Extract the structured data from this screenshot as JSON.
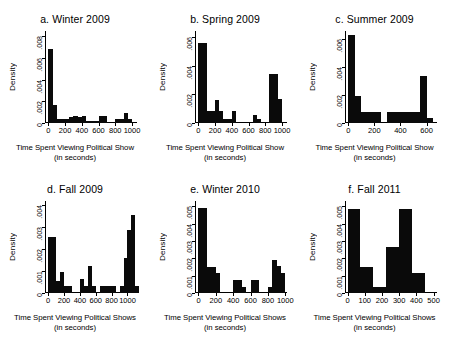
{
  "figure": {
    "panel_count": 6,
    "bar_color": "#0a0a0a",
    "axis_color": "#000000",
    "background": "#ffffff"
  },
  "common": {
    "ylabel": "Density",
    "xlabel_singular": "Time Spent Viewing Political Show",
    "xlabel_plural": "Time Spent Viewing Political Shows",
    "xunit": "(in seconds)"
  },
  "chart_data": [
    {
      "type": "bar",
      "panel": "a",
      "title": "a. Winter 2009",
      "xlabel": "Time Spent Viewing Political Show",
      "xunit": "(in seconds)",
      "ylabel": "Density",
      "xlim": [
        -40,
        1060
      ],
      "ylim": [
        0,
        0.0085
      ],
      "xticks": [
        0,
        200,
        400,
        600,
        800,
        1000
      ],
      "xticklabels": [
        "0",
        "200",
        "400",
        "600",
        "800",
        "1000"
      ],
      "yticks": [
        0,
        0.002,
        0.004,
        0.006,
        0.008
      ],
      "yticklabels": [
        "0",
        ".002",
        ".004",
        ".006",
        ".008"
      ],
      "bin_width": 50,
      "bins": [
        0,
        50,
        100,
        150,
        200,
        250,
        300,
        350,
        400,
        450,
        500,
        550,
        600,
        650,
        700,
        750,
        800,
        850,
        900,
        950,
        1000
      ],
      "values": [
        0.0068,
        0.00165,
        0.00035,
        0.00035,
        0.00035,
        0.0006,
        0.00065,
        0.0006,
        0.00065,
        0.0002,
        0.00022,
        0.0002,
        0.00065,
        0.00065,
        0.0,
        0.0,
        0.00035,
        0.00035,
        0.0009,
        0.00035
      ],
      "grid": false
    },
    {
      "type": "bar",
      "panel": "b",
      "title": "b. Spring 2009",
      "xlabel": "Time Spent Viewing Political Show",
      "xunit": "(in seconds)",
      "ylabel": "Density",
      "xlim": [
        -40,
        1060
      ],
      "ylim": [
        0,
        0.0064
      ],
      "xticks": [
        0,
        200,
        400,
        600,
        800,
        1000
      ],
      "xticklabels": [
        "0",
        "200",
        "400",
        "600",
        "800",
        "1000"
      ],
      "yticks": [
        0,
        0.002,
        0.004,
        0.006
      ],
      "yticklabels": [
        "0",
        ".002",
        ".004",
        ".006"
      ],
      "bin_width": 50,
      "bins": [
        0,
        50,
        100,
        150,
        200,
        250,
        300,
        350,
        400,
        450,
        500,
        550,
        600,
        650,
        700,
        750,
        800,
        850,
        900,
        950,
        1000
      ],
      "values": [
        0.00555,
        0.00555,
        0.00085,
        0.00085,
        0.0016,
        0.00085,
        0.00025,
        0.00025,
        0.00085,
        0.0,
        0.0,
        0.0,
        0.0,
        0.00055,
        0.00025,
        0.0,
        0.0,
        0.0034,
        0.0034,
        0.00165
      ],
      "grid": false
    },
    {
      "type": "bar",
      "panel": "c",
      "title": "c. Summer 2009",
      "xlabel": "Time Spent Viewing Political Show",
      "xunit": "(in seconds)",
      "ylabel": "Density",
      "xlim": [
        -25,
        680
      ],
      "ylim": [
        0,
        0.0066
      ],
      "xticks": [
        0,
        200,
        400,
        600
      ],
      "xticklabels": [
        "0",
        "200",
        "400",
        "600"
      ],
      "yticks": [
        0,
        0.002,
        0.004,
        0.006
      ],
      "yticklabels": [
        "0",
        ".002",
        ".004",
        ".006"
      ],
      "bin_width": 50,
      "bins": [
        0,
        50,
        100,
        150,
        200,
        250,
        300,
        350,
        400,
        450,
        500,
        550,
        600,
        650
      ],
      "values": [
        0.0063,
        0.00195,
        0.00077,
        0.00077,
        0.00077,
        0.0,
        0.00077,
        0.00077,
        0.00077,
        0.00077,
        0.00077,
        0.0034,
        0.00039
      ],
      "grid": false
    },
    {
      "type": "bar",
      "panel": "d",
      "title": "d. Fall 2009",
      "xlabel": "Time Spent Viewing Political Shows",
      "xunit": "(in seconds)",
      "ylabel": "Density",
      "xlim": [
        -40,
        1120
      ],
      "ylim": [
        0,
        0.0042
      ],
      "xticks": [
        0,
        200,
        400,
        600,
        800,
        1000
      ],
      "xticklabels": [
        "0",
        "200",
        "400",
        "600",
        "800",
        "1000"
      ],
      "yticks": [
        0,
        0.001,
        0.002,
        0.003,
        0.004
      ],
      "yticklabels": [
        "0",
        ".001",
        ".002",
        ".003",
        ".004"
      ],
      "bin_width": 50,
      "bins": [
        0,
        50,
        100,
        150,
        200,
        250,
        300,
        350,
        400,
        450,
        500,
        550,
        600,
        650,
        700,
        750,
        800,
        850,
        900,
        950,
        1000,
        1050,
        1100
      ],
      "values": [
        0.00255,
        0.00255,
        0.00055,
        0.00095,
        0.00033,
        0.00033,
        0.0,
        0.0,
        0.00065,
        0.00033,
        0.00125,
        0.00033,
        0.0,
        0.00033,
        0.00033,
        0.00033,
        0.00033,
        0.0,
        0.00033,
        0.00162,
        0.00288,
        0.00355,
        0.00033
      ],
      "grid": false
    },
    {
      "type": "bar",
      "panel": "e",
      "title": "e. Winter 2010",
      "xlabel": "Time Spent Viewing Political Shows",
      "xunit": "(in seconds)",
      "ylabel": "Density",
      "xlim": [
        -40,
        1020
      ],
      "ylim": [
        0,
        0.0053
      ],
      "xticks": [
        0,
        200,
        400,
        600,
        800,
        1000
      ],
      "xticklabels": [
        "0",
        "200",
        "400",
        "600",
        "800",
        "1000"
      ],
      "yticks": [
        0,
        0.001,
        0.002,
        0.003,
        0.004,
        0.005
      ],
      "yticklabels": [
        "0",
        ".001",
        ".002",
        ".003",
        ".004",
        ".005"
      ],
      "bin_width": 50,
      "bins": [
        0,
        50,
        100,
        150,
        200,
        250,
        300,
        350,
        400,
        450,
        500,
        550,
        600,
        650,
        700,
        750,
        800,
        850,
        900,
        950
      ],
      "values": [
        0.0049,
        0.0049,
        0.00148,
        0.00148,
        0.00115,
        0.0,
        0.0,
        0.0,
        0.00075,
        0.00075,
        0.00035,
        0.0,
        0.00075,
        0.00075,
        0.0,
        0.0,
        0.00035,
        0.00192,
        0.00155,
        0.00118
      ],
      "grid": false
    },
    {
      "type": "bar",
      "panel": "f",
      "title": "f. Fall 2011",
      "xlabel": "Time Spent Viewing Political Shows",
      "xunit": "(in seconds)",
      "ylabel": "Density",
      "xlim": [
        -15,
        520
      ],
      "ylim": [
        0,
        0.0053
      ],
      "xticks": [
        0,
        100,
        200,
        300,
        400,
        500
      ],
      "xticklabels": [
        "0",
        "100",
        "200",
        "300",
        "400",
        "500"
      ],
      "yticks": [
        0,
        0.001,
        0.002,
        0.003,
        0.004,
        0.005
      ],
      "yticklabels": [
        "0",
        ".001",
        ".002",
        ".003",
        ".004",
        ".005"
      ],
      "bin_width": 75,
      "bins": [
        0,
        75,
        150,
        225,
        300,
        375,
        450
      ],
      "values": [
        0.00485,
        0.00148,
        0.00035,
        0.00265,
        0.00485,
        0.00118
      ],
      "grid": false
    }
  ]
}
